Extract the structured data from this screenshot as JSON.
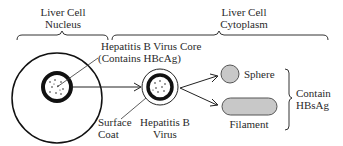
{
  "diagram": {
    "regions": {
      "nucleus": [
        "Liver Cell",
        "Nucleus"
      ],
      "cytoplasm": [
        "Liver Cell",
        "Cytoplasm"
      ]
    },
    "labels": {
      "core": [
        "Hepatitis B Virus Core",
        "(Contains HBcAg)"
      ],
      "surface_coat": [
        "Surface",
        "Coat"
      ],
      "virus": [
        "Hepatitis B",
        "Virus"
      ],
      "sphere": "Sphere",
      "filament": "Filament",
      "contain": [
        "Contain",
        "HBsAg"
      ]
    },
    "colors": {
      "ink": "#1a1a1a",
      "particle_fill": "#c8c8c8",
      "particle_stroke": "#555555"
    }
  }
}
